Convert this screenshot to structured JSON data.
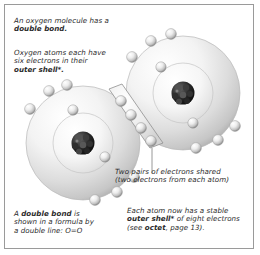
{
  "figure": {
    "border_color": "#9a9a9a",
    "background": "#ffffff",
    "text_color": "#2b2b2b"
  },
  "captions": {
    "intro": {
      "name": "intro-caption",
      "lines": [
        {
          "text": "An oxygen molecule has a",
          "bold": false
        },
        {
          "text": "double bond.",
          "bold": true
        }
      ]
    },
    "six_electrons": {
      "name": "six-electrons-caption",
      "lines": [
        {
          "text": "Oxygen atoms each have",
          "bold": false
        },
        {
          "text": "six electrons in their",
          "bold": false
        },
        {
          "text": "outer shell*.",
          "bold": true
        }
      ]
    },
    "shared": {
      "name": "shared-electrons-caption",
      "lines": [
        {
          "text": "Two pairs of electrons shared",
          "bold": false
        },
        {
          "text": "(two electrons from each atom)",
          "bold": false
        }
      ]
    },
    "double_bond": {
      "name": "double-bond-caption",
      "lines": [
        {
          "text": "A double bond is",
          "bold": false
        },
        {
          "text": "shown in a formula by",
          "bold": false
        },
        {
          "text": "a double line: O=O",
          "bold": false
        }
      ],
      "bold_words": [
        "double bond"
      ]
    },
    "octet": {
      "name": "octet-caption",
      "lines": [
        {
          "text": "Each atom now has a stable",
          "bold": false
        },
        {
          "text": "outer shell* of eight electrons",
          "bold": false
        },
        {
          "text": "(see octet, page 13).",
          "bold": false
        }
      ],
      "bold_words": [
        "outer shell*",
        "octet"
      ]
    }
  },
  "diagram": {
    "type": "molecule-orbital-diagram",
    "molecule": "O=O",
    "atoms": [
      {
        "name": "left-oxygen-atom",
        "cx": 78,
        "cy": 138,
        "outer_r": 57,
        "inner_r": 30,
        "nucleus": {
          "cx": 78,
          "cy": 138,
          "r": 11,
          "color": "#1b1b1b"
        },
        "inner_electrons": [
          {
            "x": 68,
            "y": 105
          },
          {
            "x": 100,
            "y": 152
          }
        ],
        "outer_electrons": [
          {
            "x": 44,
            "y": 86
          },
          {
            "x": 62,
            "y": 80
          },
          {
            "x": 24,
            "y": 104
          },
          {
            "x": 110,
            "y": 186
          },
          {
            "x": 88,
            "y": 194
          },
          {
            "x": 128,
            "y": 172
          }
        ]
      },
      {
        "name": "right-oxygen-atom",
        "cx": 178,
        "cy": 88,
        "outer_r": 57,
        "inner_r": 30,
        "nucleus": {
          "cx": 178,
          "cy": 88,
          "r": 11,
          "color": "#1b1b1b"
        },
        "inner_electrons": [
          {
            "x": 156,
            "y": 62
          },
          {
            "x": 188,
            "y": 118
          }
        ],
        "outer_electrons": [
          {
            "x": 146,
            "y": 36
          },
          {
            "x": 166,
            "y": 30
          },
          {
            "x": 126,
            "y": 52
          },
          {
            "x": 212,
            "y": 134
          },
          {
            "x": 190,
            "y": 142
          },
          {
            "x": 230,
            "y": 122
          }
        ]
      }
    ],
    "bond": {
      "name": "shared-electron-bond",
      "label": "double bond overlap region",
      "shared_electrons": [
        {
          "x": 116,
          "y": 96
        },
        {
          "x": 126,
          "y": 108
        },
        {
          "x": 136,
          "y": 120
        },
        {
          "x": 146,
          "y": 132
        }
      ],
      "electron_count": 4
    },
    "leader_line": {
      "name": "shared-electrons-leader-line",
      "x1": 147,
      "y1": 143,
      "x2": 147,
      "y2": 168
    },
    "colors": {
      "shell_light": "#fdfdfd",
      "shell_mid": "#d8d8d8",
      "shell_edge": "#b4b4b4",
      "electron_light": "#ffffff",
      "electron_mid": "#c9c9c9",
      "electron_dark": "#8b8b8b",
      "nucleus": "#1b1b1b"
    }
  }
}
